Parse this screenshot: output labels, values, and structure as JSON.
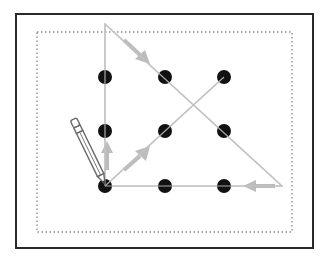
{
  "diagram": {
    "colors": {
      "frame": "#2a2a2a",
      "dotted_boundary": "#8a8a8a",
      "dot": "#111111",
      "line": "#c4c4c4",
      "arrow": "#bcbcbc",
      "pencil": "#6a6a6a"
    },
    "frame": {
      "x": 16,
      "y": 14,
      "w": 297,
      "h": 234
    },
    "boundary": {
      "x": 37,
      "y": 32,
      "w": 255,
      "h": 200
    },
    "dots": [
      {
        "row": 1,
        "col": 1,
        "x": 105,
        "y": 77
      },
      {
        "row": 1,
        "col": 2,
        "x": 165,
        "y": 77
      },
      {
        "row": 1,
        "col": 3,
        "x": 224,
        "y": 77
      },
      {
        "row": 2,
        "col": 1,
        "x": 105,
        "y": 131
      },
      {
        "row": 2,
        "col": 2,
        "x": 165,
        "y": 131
      },
      {
        "row": 2,
        "col": 3,
        "x": 224,
        "y": 131
      },
      {
        "row": 3,
        "col": 1,
        "x": 105,
        "y": 186
      },
      {
        "row": 3,
        "col": 2,
        "x": 165,
        "y": 186
      },
      {
        "row": 3,
        "col": 3,
        "x": 224,
        "y": 186
      }
    ],
    "path_points": [
      {
        "x": 105,
        "y": 186
      },
      {
        "x": 224,
        "y": 77
      }
    ],
    "triangle": [
      {
        "x": 105,
        "y": 186
      },
      {
        "x": 105,
        "y": 24
      },
      {
        "x": 282,
        "y": 186
      }
    ],
    "stroke_count": 4,
    "caption": "Connect all nine dots with four straight lines without lifting the pencil"
  }
}
